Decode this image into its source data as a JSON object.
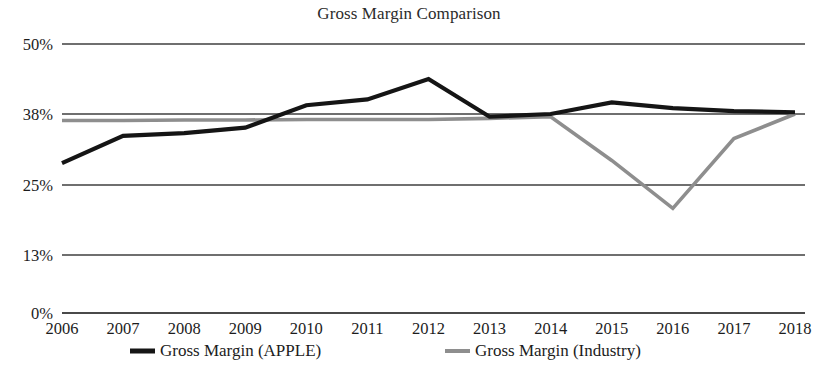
{
  "chart_data": {
    "type": "line",
    "title": "Gross Margin Comparison",
    "xlabel": "",
    "ylabel": "",
    "categories": [
      "2006",
      "2007",
      "2008",
      "2009",
      "2010",
      "2011",
      "2012",
      "2013",
      "2014",
      "2015",
      "2016",
      "2017",
      "2018"
    ],
    "series": [
      {
        "name": "Gross Margin (APPLE)",
        "color": "#151515",
        "values": [
          29.0,
          34.0,
          34.5,
          35.5,
          39.5,
          40.5,
          44.0,
          37.5,
          38.0,
          40.0,
          39.0,
          38.5,
          38.3
        ]
      },
      {
        "name": "Gross Margin (Industry)",
        "color": "#8e8e8e",
        "values": [
          36.8,
          36.8,
          36.9,
          36.9,
          37.0,
          37.0,
          37.0,
          37.2,
          37.5,
          29.5,
          21.0,
          33.5,
          38.0
        ]
      }
    ],
    "ylim": [
      0,
      50
    ],
    "yticks": [
      0,
      13,
      25,
      38,
      50
    ],
    "ytick_labels": [
      "0%",
      "13%",
      "25%",
      "38%",
      "50%"
    ],
    "grid": true,
    "legend_position": "bottom",
    "legend": [
      {
        "label": "Gross Margin (APPLE)",
        "color": "#151515"
      },
      {
        "label": "Gross Margin (Industry)",
        "color": "#8e8e8e"
      }
    ]
  },
  "layout": {
    "plot_left": 62,
    "plot_right": 795,
    "y_px": {
      "0": 313,
      "13": 255,
      "25": 185,
      "38": 114,
      "50": 44
    }
  }
}
